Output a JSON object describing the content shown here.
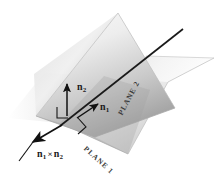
{
  "figure": {
    "type": "geometry-diagram",
    "background_color": "#ffffff"
  },
  "planes": [
    {
      "id": "plane1",
      "label": "PLANE 1",
      "orientation": "vertical-tilted",
      "fill_light": "#f2f2f2",
      "fill_dark": "#a8a8a8",
      "edge_color": "#b4b4b4"
    },
    {
      "id": "plane2",
      "label": "PLANE 2",
      "orientation": "horizontal-receding",
      "fill_light": "#fafafa",
      "fill_dark": "#c4c4c4",
      "edge_color": "#c0c0c0"
    }
  ],
  "vectors": [
    {
      "id": "n1",
      "name": "n",
      "subscript": "1",
      "description": "normal vector of PLANE 1",
      "direction": "up-right",
      "color": "#111111"
    },
    {
      "id": "n2",
      "name": "n",
      "subscript": "2",
      "description": "normal vector of PLANE 2",
      "direction": "up",
      "color": "#111111"
    },
    {
      "id": "n1-cross-n2",
      "name": "n",
      "subscript_a": "1",
      "operator": "×",
      "name_b": "n",
      "subscript_b": "2",
      "description": "cross product along the line of intersection",
      "direction": "down-left",
      "color": "#111111"
    }
  ],
  "intersection_line": {
    "id": "intersection",
    "description": "line of intersection of PLANE 1 and PLANE 2",
    "color": "#1a1a1a"
  },
  "right_angle_markers": [
    {
      "id": "right-angle-n2",
      "description": "right angle between n2 and plane"
    },
    {
      "id": "right-angle-n1",
      "description": "right angle between n1 and plane"
    }
  ]
}
